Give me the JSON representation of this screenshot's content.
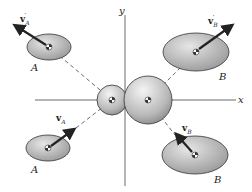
{
  "diagram": {
    "type": "collision-of-two-disks",
    "axes": {
      "x_label": "x",
      "y_label": "y"
    },
    "bodies": {
      "before": [
        {
          "id": "A",
          "label": "A",
          "velocity": "v",
          "velocity_sub": "A",
          "position": "lower-left"
        },
        {
          "id": "B",
          "label": "B",
          "velocity": "v",
          "velocity_sub": "B",
          "position": "lower-right"
        }
      ],
      "after": [
        {
          "id": "A",
          "label": "A",
          "velocity": "v",
          "velocity_sub": "A",
          "prime": "′",
          "position": "upper-left"
        },
        {
          "id": "B",
          "label": "B",
          "velocity": "v",
          "velocity_sub": "B",
          "prime": "′",
          "position": "upper-right"
        }
      ],
      "contact": [
        {
          "id": "A",
          "role": "small sphere at origin (left)"
        },
        {
          "id": "B",
          "role": "large sphere at origin (right)"
        }
      ]
    },
    "colors": {
      "body_fill": "#b5b5b5",
      "body_stroke": "#333333",
      "line": "#444444",
      "background": "#ffffff"
    }
  }
}
